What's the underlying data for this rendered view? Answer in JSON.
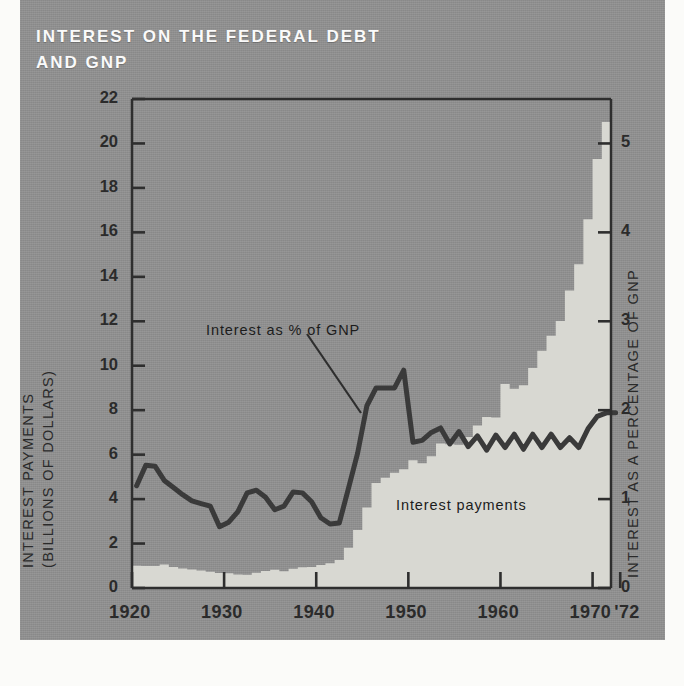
{
  "title": "INTEREST ON THE FEDERAL DEBT\nAND GNP",
  "axes": {
    "left_title_line1": "INTEREST PAYMENTS",
    "left_title_line2": "(BILLIONS OF DOLLARS)",
    "right_title": "INTEREST AS A PERCENTAGE OF GNP",
    "left_ticks": [
      "0",
      "2",
      "4",
      "6",
      "8",
      "10",
      "12",
      "14",
      "16",
      "18",
      "20",
      "22"
    ],
    "right_ticks": [
      "0",
      "1",
      "2",
      "3",
      "4",
      "5"
    ],
    "x_ticks": [
      "1920",
      "1930",
      "1940",
      "1950",
      "1960",
      "1970",
      "'72"
    ]
  },
  "annotations": {
    "line_label": "Interest as % of GNP",
    "area_label": "Interest payments"
  },
  "colors": {
    "panel": "#8e8e8e",
    "area_fill": "#d8d8d2",
    "line": "#3a3a3a",
    "frame": "#2e2e2e",
    "title_text": "#fafafa",
    "tick_text": "#2b2b2b"
  },
  "chart_data": {
    "type": "area",
    "title": "INTEREST ON THE FEDERAL DEBT AND GNP",
    "xlabel": "",
    "ylabel": "INTEREST PAYMENTS (BILLIONS OF DOLLARS)",
    "y2label": "INTEREST AS A PERCENTAGE OF GNP",
    "xlim": [
      1920,
      1972
    ],
    "ylim": [
      0,
      22
    ],
    "y2lim": [
      0,
      5.5
    ],
    "grid": false,
    "legend": "annotated-inline",
    "x": [
      1920,
      1921,
      1922,
      1923,
      1924,
      1925,
      1926,
      1927,
      1928,
      1929,
      1930,
      1931,
      1932,
      1933,
      1934,
      1935,
      1936,
      1937,
      1938,
      1939,
      1940,
      1941,
      1942,
      1943,
      1944,
      1945,
      1946,
      1947,
      1948,
      1949,
      1950,
      1951,
      1952,
      1953,
      1954,
      1955,
      1956,
      1957,
      1958,
      1959,
      1960,
      1961,
      1962,
      1963,
      1964,
      1965,
      1966,
      1967,
      1968,
      1969,
      1970,
      1971,
      1972
    ],
    "series": [
      {
        "name": "Interest payments",
        "axis": "left",
        "units": "billions of dollars",
        "type": "area",
        "values": [
          1.0,
          0.99,
          0.99,
          1.06,
          0.94,
          0.88,
          0.83,
          0.79,
          0.73,
          0.68,
          0.66,
          0.61,
          0.6,
          0.69,
          0.76,
          0.82,
          0.75,
          0.87,
          0.93,
          0.94,
          1.04,
          1.11,
          1.26,
          1.81,
          2.61,
          3.62,
          4.72,
          4.96,
          5.19,
          5.34,
          5.75,
          5.61,
          5.93,
          6.5,
          6.47,
          6.44,
          6.79,
          7.31,
          7.69,
          7.67,
          9.18,
          8.96,
          9.12,
          9.9,
          10.67,
          11.35,
          12.01,
          13.39,
          14.57,
          16.59,
          19.3,
          20.96,
          21.45
        ]
      },
      {
        "name": "Interest as % of GNP",
        "axis": "right",
        "units": "percent of GNP",
        "type": "line",
        "values": [
          1.15,
          1.38,
          1.37,
          1.21,
          1.13,
          1.05,
          0.98,
          0.95,
          0.92,
          0.69,
          0.74,
          0.86,
          1.07,
          1.1,
          1.02,
          0.88,
          0.92,
          1.08,
          1.07,
          0.97,
          0.79,
          0.72,
          0.73,
          1.12,
          1.52,
          2.05,
          2.25,
          2.25,
          2.25,
          2.45,
          1.64,
          1.66,
          1.75,
          1.8,
          1.62,
          1.76,
          1.59,
          1.71,
          1.55,
          1.72,
          1.58,
          1.73,
          1.56,
          1.73,
          1.58,
          1.73,
          1.58,
          1.69,
          1.58,
          1.79,
          1.93,
          1.97,
          1.97
        ]
      }
    ]
  }
}
